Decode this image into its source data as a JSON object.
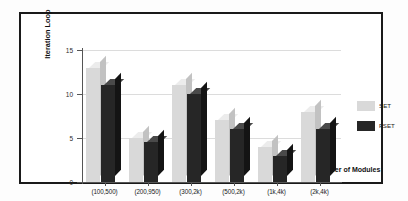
{
  "chart_data": {
    "type": "bar",
    "title": "",
    "xlabel": "Number of Modules",
    "ylabel": "Iteration Loop",
    "categories": [
      "(100,500)",
      "(200,950)",
      "(300,2k)",
      "(500,2k)",
      "(1k,4k)",
      "(2k,4k)"
    ],
    "series": [
      {
        "name": "SET",
        "color": "#d9d9d9",
        "values": [
          13,
          5,
          11,
          7,
          4,
          8
        ]
      },
      {
        "name": "FSET",
        "color": "#262626",
        "values": [
          11,
          4.5,
          10,
          6,
          3,
          6
        ]
      }
    ],
    "ylim": [
      0,
      15
    ],
    "yticks": [
      0,
      5,
      10,
      15
    ],
    "ytick_labels": [
      "0",
      "5",
      "10",
      "15"
    ],
    "grid": true,
    "legend_position": "right",
    "style": "3d-grouped-bar"
  },
  "legend": {
    "items": [
      {
        "label": "SET"
      },
      {
        "label": "FSET"
      }
    ]
  }
}
